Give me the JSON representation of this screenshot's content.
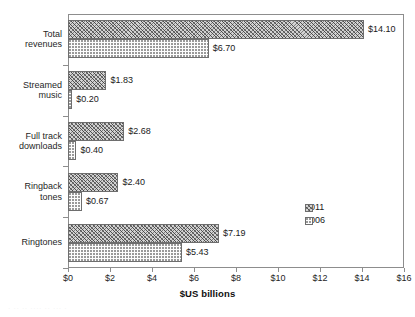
{
  "chart_data": {
    "type": "bar",
    "orientation": "horizontal",
    "title": "",
    "xlabel": "$US billions",
    "ylabel": "",
    "xlim": [
      0,
      16
    ],
    "xticks": [
      "$0",
      "$2",
      "$4",
      "$6",
      "$8",
      "$10",
      "$12",
      "$14",
      "$16"
    ],
    "xtick_values": [
      0,
      2,
      4,
      6,
      8,
      10,
      12,
      14,
      16
    ],
    "grid": false,
    "legend_position": "lower-right-inside",
    "categories": [
      "Total\nrevenues",
      "Streamed\nmusic",
      "Full track\ndownloads",
      "Ringback\ntones",
      "Ringtones"
    ],
    "series": [
      {
        "name": "2011",
        "values": [
          14.1,
          1.83,
          2.68,
          2.4,
          7.19
        ],
        "labels": [
          "$14.10",
          "$1.83",
          "$2.68",
          "$2.40",
          "$7.19"
        ],
        "pattern": "diagonal-crosshatch",
        "fill": "#d2d2d2",
        "edge": "#6e6e6e"
      },
      {
        "name": "2006",
        "values": [
          6.7,
          0.2,
          0.4,
          0.67,
          5.43
        ],
        "labels": [
          "$6.70",
          "$0.20",
          "$0.40",
          "$0.67",
          "$5.43"
        ],
        "pattern": "dotted-stipple",
        "fill": "#fdfdfd",
        "edge": "#6e6e6e"
      }
    ]
  },
  "legend": {
    "entries": [
      {
        "label": "2011"
      },
      {
        "label": "2006"
      }
    ]
  },
  "artifact": {
    "text": "· ·· ·· ···· ·· ··· ·"
  }
}
